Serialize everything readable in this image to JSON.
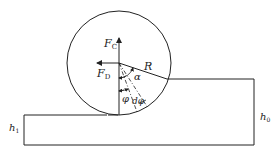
{
  "diagram": {
    "labels": {
      "force_vertical": "F",
      "force_vertical_sub": "C",
      "force_horizontal": "F",
      "force_horizontal_sub": "D",
      "radius": "R",
      "angle_alpha": "α",
      "angle_phi": "φ",
      "angle_dphi": "dφ",
      "height_entry": "h",
      "height_entry_sub": "0",
      "height_exit": "h",
      "height_exit_sub": "1"
    },
    "colors": {
      "stroke": "#222222",
      "background": "#ffffff"
    }
  }
}
